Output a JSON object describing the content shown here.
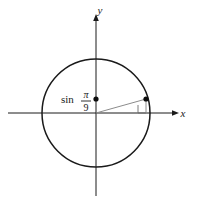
{
  "figure": {
    "name": "unit-circle-diagram",
    "background": "#ffffff",
    "stroke_color": "#1a1a1a",
    "radius_line_color": "#8c8c8c"
  },
  "axes": {
    "x_label": "x",
    "y_label": "y",
    "origin": {
      "x": 96,
      "y": 113
    },
    "x_axis": {
      "x1": 8,
      "y1": 113,
      "x2": 176,
      "y2": 113
    },
    "y_axis": {
      "x1": 96,
      "y1": 196,
      "x2": 96,
      "y2": 16
    },
    "x_label_pos": {
      "x": 183,
      "y": 117
    },
    "y_label_pos": {
      "x": 99,
      "y": 14
    }
  },
  "circle": {
    "center_x": 96,
    "center_y": 113,
    "radius": 54,
    "stroke_width": 1.4
  },
  "radius_segment": {
    "from_x": 96,
    "from_y": 113,
    "to_x": 146,
    "to_y": 99
  },
  "drop_segment": {
    "from_x": 146,
    "from_y": 99,
    "to_x": 146,
    "to_y": 113
  },
  "right_angle_marker": {
    "x": 138,
    "y": 105,
    "size": 8
  },
  "points": [
    {
      "name": "point-on-circle",
      "x": 146,
      "y": 99,
      "r": 2.6
    },
    {
      "name": "point-on-y-axis",
      "x": 96,
      "y": 99,
      "r": 2.6
    }
  ],
  "label": {
    "function_name": "sin",
    "numerator": "π",
    "denominator": "9",
    "full_text": "sin π/9",
    "text_x": 61,
    "text_y": 103,
    "frac_x": 86,
    "frac_num_y": 98,
    "frac_bar_y": 101,
    "frac_den_y": 111
  }
}
